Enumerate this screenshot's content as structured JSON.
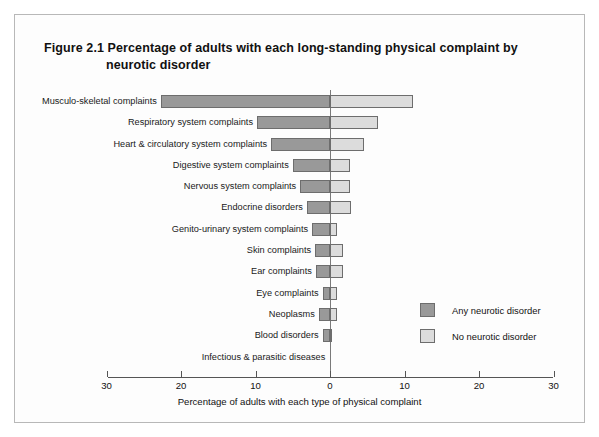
{
  "figure": {
    "number": "Figure 2.1",
    "title_line_1": "Figure 2.1  Percentage of adults with each long-standing physical complaint by",
    "title_line_2": "neurotic disorder"
  },
  "legend": {
    "items": [
      {
        "label": "Any neurotic disorder",
        "color": "#999999",
        "key": "any"
      },
      {
        "label": "No neurotic disorder",
        "color": "#dcdcdc",
        "key": "no"
      }
    ]
  },
  "chart_data": {
    "type": "bar",
    "orientation": "horizontal",
    "layout": "bidirectional-tornado",
    "title": "Percentage of adults with each long-standing physical complaint by neurotic disorder",
    "xlabel": "Percentage of adults with each type of physical complaint",
    "ylabel": "",
    "xlim": [
      -30,
      30
    ],
    "xticks": [
      -30,
      -20,
      -10,
      0,
      10,
      20,
      30
    ],
    "xticklabels": [
      "30",
      "20",
      "10",
      "0",
      "10",
      "20",
      "30"
    ],
    "grid": false,
    "legend_position": "inside-right",
    "categories": [
      "Musculo-skeletal complaints",
      "Respiratory system complaints",
      "Heart & circulatory system complaints",
      "Digestive system complaints",
      "Nervous system complaints",
      "Endocrine disorders",
      "Genito-urinary system complaints",
      "Skin complaints",
      "Ear complaints",
      "Eye complaints",
      "Neoplasms",
      "Blood disorders",
      "Infectious & parasitic diseases"
    ],
    "series": [
      {
        "name": "Any neurotic disorder",
        "side": "left",
        "color": "#999999",
        "values": [
          22.7,
          9.8,
          7.9,
          5.0,
          4.0,
          3.1,
          2.4,
          2.0,
          1.9,
          1.0,
          1.5,
          1.0,
          0.1
        ]
      },
      {
        "name": "No neurotic disorder",
        "side": "right",
        "color": "#dcdcdc",
        "values": [
          11.1,
          6.4,
          4.6,
          2.7,
          2.7,
          2.8,
          1.0,
          1.7,
          1.8,
          1.0,
          1.0,
          0.3,
          0.1
        ]
      }
    ]
  }
}
